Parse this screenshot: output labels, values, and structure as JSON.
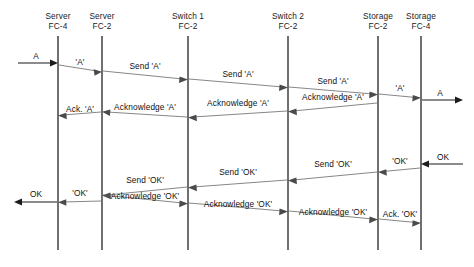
{
  "diagram": {
    "type": "sequence-diagram",
    "colors": {
      "background": "#ffffff",
      "lifeline": "#1b1b1b",
      "solid_arrow": "#1b1b1b",
      "thin_arrow": "#5d5d5d",
      "text": "#111111"
    }
  },
  "lanes": [
    {
      "id": "server-fc4",
      "line1": "Server",
      "line2": "FC-4",
      "x": 58
    },
    {
      "id": "server-fc2",
      "line1": "Server",
      "line2": "FC-2",
      "x": 102
    },
    {
      "id": "switch1-fc2",
      "line1": "Switch 1",
      "line2": "FC-2",
      "x": 188
    },
    {
      "id": "switch2-fc2",
      "line1": "Switch 2",
      "line2": "FC-2",
      "x": 288
    },
    {
      "id": "storage-fc2",
      "line1": "Storage",
      "line2": "FC-2",
      "x": 378
    },
    {
      "id": "storage-fc4",
      "line1": "Storage",
      "line2": "FC-4",
      "x": 421
    }
  ],
  "messages": [
    {
      "id": "in-a",
      "label": "A",
      "kind": "solid",
      "dir": "right"
    },
    {
      "id": "a-1",
      "label": "'A'",
      "kind": "thin",
      "dir": "right"
    },
    {
      "id": "send-a-1",
      "label": "Send 'A'",
      "kind": "thin",
      "dir": "right"
    },
    {
      "id": "send-a-2",
      "label": "Send 'A'",
      "kind": "thin",
      "dir": "right"
    },
    {
      "id": "send-a-3",
      "label": "Send 'A'",
      "kind": "thin",
      "dir": "right"
    },
    {
      "id": "a-2",
      "label": "'A'",
      "kind": "thin",
      "dir": "right"
    },
    {
      "id": "out-a",
      "label": "A",
      "kind": "solid",
      "dir": "right"
    },
    {
      "id": "ack-a-short",
      "label": "Ack. 'A'",
      "kind": "thin",
      "dir": "left"
    },
    {
      "id": "ack-a-1",
      "label": "Acknowledge 'A'",
      "kind": "thin",
      "dir": "left"
    },
    {
      "id": "ack-a-2",
      "label": "Acknowledge 'A'",
      "kind": "thin",
      "dir": "left"
    },
    {
      "id": "ack-a-3",
      "label": "Acknowledge 'A'",
      "kind": "thin",
      "dir": "left"
    },
    {
      "id": "in-ok",
      "label": "OK",
      "kind": "solid",
      "dir": "left"
    },
    {
      "id": "ok-1",
      "label": "'OK'",
      "kind": "thin",
      "dir": "left"
    },
    {
      "id": "send-ok-1",
      "label": "Send 'OK'",
      "kind": "thin",
      "dir": "left"
    },
    {
      "id": "send-ok-2",
      "label": "Send 'OK'",
      "kind": "thin",
      "dir": "left"
    },
    {
      "id": "send-ok-3",
      "label": "Send 'OK'",
      "kind": "thin",
      "dir": "left"
    },
    {
      "id": "ok-2",
      "label": "'OK'",
      "kind": "thin",
      "dir": "left"
    },
    {
      "id": "out-ok",
      "label": "OK",
      "kind": "solid",
      "dir": "left"
    },
    {
      "id": "ack-ok-1",
      "label": "Acknowledge 'OK'",
      "kind": "thin",
      "dir": "right"
    },
    {
      "id": "ack-ok-2",
      "label": "Acknowledge 'OK'",
      "kind": "thin",
      "dir": "right"
    },
    {
      "id": "ack-ok-3",
      "label": "Acknowledge 'OK'",
      "kind": "thin",
      "dir": "right"
    },
    {
      "id": "ack-ok-short",
      "label": "Ack. 'OK'",
      "kind": "thin",
      "dir": "right"
    }
  ]
}
